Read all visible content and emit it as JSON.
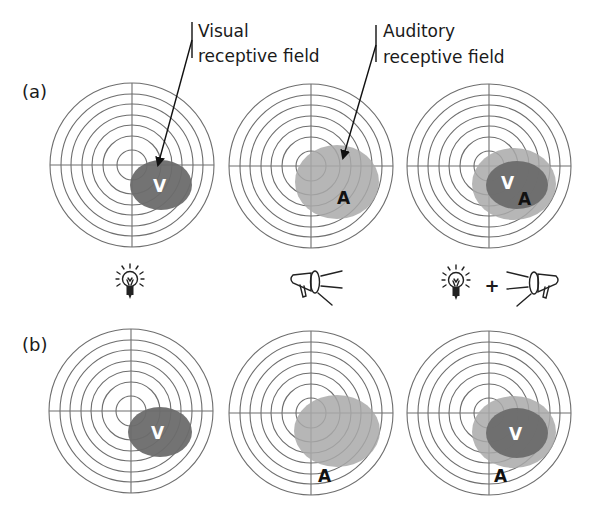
{
  "figure": {
    "panel_labels": [
      {
        "id": "a",
        "text": "(a)",
        "x": 22,
        "y": 98
      },
      {
        "id": "b",
        "text": "(b)",
        "x": 22,
        "y": 351
      }
    ],
    "captions": [
      {
        "id": "visual",
        "lines": [
          "Visual",
          "receptive field"
        ],
        "x": 198,
        "y1": 37,
        "y2": 62,
        "tick": {
          "x": 192,
          "y1": 22,
          "y2": 58
        },
        "arrow": {
          "x1": 192,
          "y1": 40,
          "x2": 158,
          "y2": 165
        }
      },
      {
        "id": "auditory",
        "lines": [
          "Auditory",
          "receptive field"
        ],
        "x": 383,
        "y1": 37,
        "y2": 63,
        "tick": {
          "x": 376,
          "y1": 25,
          "y2": 62
        },
        "arrow": {
          "x1": 376,
          "y1": 45,
          "x2": 343,
          "y2": 158
        }
      }
    ],
    "target_style": {
      "ring_radii": [
        82,
        71,
        61,
        50,
        40,
        29,
        15
      ],
      "ring_color": "#6e6e6e"
    },
    "colors": {
      "visual_field": "#6b6b6b",
      "auditory_field": "#a9a9a9",
      "auditory_field_opacity": 0.85,
      "visual_letter": "#ffffff",
      "auditory_letter": "#111111"
    },
    "rows": [
      {
        "id": "a",
        "targets": [
          {
            "cx": 132,
            "cy": 165,
            "fields": [
              {
                "type": "V",
                "cx": 161,
                "cy": 185,
                "rx": 31,
                "ry": 25
              }
            ],
            "letters": [
              {
                "text": "V",
                "x": 153,
                "y": 192,
                "color": "visual"
              }
            ]
          },
          {
            "cx": 311,
            "cy": 166,
            "fields": [
              {
                "type": "A",
                "cx": 337,
                "cy": 182,
                "rx": 42,
                "ry": 37
              }
            ],
            "letters": [
              {
                "text": "A",
                "x": 337,
                "y": 204,
                "color": "auditory"
              }
            ]
          },
          {
            "cx": 489,
            "cy": 166,
            "fields": [
              {
                "type": "A",
                "cx": 514,
                "cy": 184,
                "rx": 42,
                "ry": 36
              },
              {
                "type": "V",
                "cx": 517,
                "cy": 185,
                "rx": 31,
                "ry": 24
              }
            ],
            "letters": [
              {
                "text": "V",
                "x": 501,
                "y": 189,
                "color": "visual"
              },
              {
                "text": "A",
                "x": 518,
                "y": 205,
                "color": "auditory"
              }
            ]
          }
        ]
      },
      {
        "id": "b",
        "targets": [
          {
            "cx": 131,
            "cy": 411,
            "fields": [
              {
                "type": "V",
                "cx": 160,
                "cy": 432,
                "rx": 32,
                "ry": 25
              }
            ],
            "letters": [
              {
                "text": "V",
                "x": 151,
                "y": 439,
                "color": "visual"
              }
            ]
          },
          {
            "cx": 311,
            "cy": 413,
            "fields": [
              {
                "type": "A",
                "cx": 337,
                "cy": 431,
                "rx": 43,
                "ry": 36
              }
            ],
            "letters": [
              {
                "text": "A",
                "x": 318,
                "y": 482,
                "color": "auditory"
              }
            ]
          },
          {
            "cx": 489,
            "cy": 413,
            "fields": [
              {
                "type": "A",
                "cx": 514,
                "cy": 432,
                "rx": 42,
                "ry": 36
              },
              {
                "type": "V",
                "cx": 517,
                "cy": 433,
                "rx": 31,
                "ry": 25
              }
            ],
            "letters": [
              {
                "text": "V",
                "x": 509,
                "y": 440,
                "color": "visual"
              },
              {
                "text": "A",
                "x": 494,
                "y": 482,
                "color": "auditory"
              }
            ]
          }
        ]
      }
    ],
    "stimuli": [
      {
        "id": "visual-stimulus",
        "icons": [
          {
            "type": "lightbulb-icon",
            "x": 130,
            "y": 281
          }
        ]
      },
      {
        "id": "auditory-stimulus",
        "icons": [
          {
            "type": "megaphone-icon",
            "x": 315,
            "y": 283,
            "flip": false
          }
        ]
      },
      {
        "id": "combined-stimulus",
        "icons": [
          {
            "type": "lightbulb-icon",
            "x": 456,
            "y": 282
          },
          {
            "type": "plus-sign",
            "x": 492,
            "y": 292,
            "text": "+"
          },
          {
            "type": "megaphone-icon",
            "x": 534,
            "y": 284,
            "flip": true
          }
        ]
      }
    ]
  }
}
